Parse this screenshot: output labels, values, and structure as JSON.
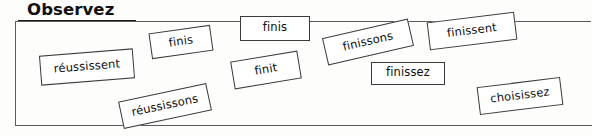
{
  "page": {
    "title": "Observez",
    "background_color": "#fdfdfc",
    "frame_border_color": "#5b5b5b",
    "card_border_color": "#3a3a3a",
    "text_color": "#0d0d0d"
  },
  "heading": {
    "label": "Observez",
    "underlined": true
  },
  "word_cards": [
    {
      "label": "réussissent",
      "left": 40,
      "top": 52,
      "width": 94,
      "height": 30,
      "rotation": -4.5
    },
    {
      "label": "finis",
      "left": 150,
      "top": 29,
      "width": 62,
      "height": 26,
      "rotation": -8
    },
    {
      "label": "finis",
      "left": 240,
      "top": 16,
      "width": 70,
      "height": 25,
      "rotation": 0
    },
    {
      "label": "finissons",
      "left": 324,
      "top": 28,
      "width": 88,
      "height": 28,
      "rotation": -13
    },
    {
      "label": "finissent",
      "left": 428,
      "top": 17,
      "width": 88,
      "height": 28,
      "rotation": -7
    },
    {
      "label": "finit",
      "left": 232,
      "top": 56,
      "width": 68,
      "height": 28,
      "rotation": -9.5
    },
    {
      "label": "finissez",
      "left": 371,
      "top": 62,
      "width": 74,
      "height": 23,
      "rotation": 0
    },
    {
      "label": "réussissons",
      "left": 120,
      "top": 92,
      "width": 90,
      "height": 28,
      "rotation": -12
    },
    {
      "label": "choisissez",
      "left": 478,
      "top": 82,
      "width": 84,
      "height": 28,
      "rotation": -7
    }
  ]
}
